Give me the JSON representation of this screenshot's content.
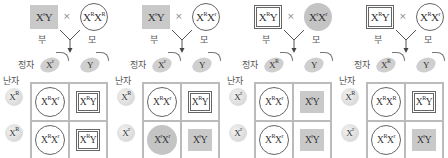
{
  "labels": {
    "father": "부",
    "mother": "모",
    "sperm": "정자",
    "egg": "난자",
    "cross": "×"
  },
  "colors": {
    "affected_fill": "#c4c4c4",
    "outline": "#666666",
    "grid_line": "#bbbbbb"
  },
  "legend_hint": "□ 정상 남자, ■ 적록 색맹 남자, ○ 정상 여자, ● 적록 색맹 여자",
  "panels": [
    {
      "father": {
        "geno": "XʳY",
        "style": "filled-square"
      },
      "mother": {
        "geno": "XᴿXᴿ",
        "style": "outline-circle"
      },
      "sperm": [
        "Xʳ",
        "Y"
      ],
      "eggs": [
        "Xᴿ",
        "Xᴿ"
      ],
      "offspring": [
        [
          {
            "geno": "XᴿXʳ",
            "style": "outline-circle"
          },
          {
            "geno": "XᴿY",
            "style": "outline-square"
          }
        ],
        [
          {
            "geno": "XᴿXʳ",
            "style": "outline-circle"
          },
          {
            "geno": "XᴿY",
            "style": "outline-square"
          }
        ]
      ]
    },
    {
      "father": {
        "geno": "XʳY",
        "style": "filled-square"
      },
      "mother": {
        "geno": "XᴿXʳ",
        "style": "outline-circle"
      },
      "sperm": [
        "Xʳ",
        "Y"
      ],
      "eggs": [
        "Xᴿ",
        "Xʳ"
      ],
      "offspring": [
        [
          {
            "geno": "XᴿXʳ",
            "style": "outline-circle"
          },
          {
            "geno": "XᴿY",
            "style": "outline-square"
          }
        ],
        [
          {
            "geno": "XʳXʳ",
            "style": "filled-circle"
          },
          {
            "geno": "XʳY",
            "style": "filled-square"
          }
        ]
      ]
    },
    {
      "father": {
        "geno": "XᴿY",
        "style": "outline-square"
      },
      "mother": {
        "geno": "XʳXʳ",
        "style": "filled-circle"
      },
      "sperm": [
        "Xᴿ",
        "Y"
      ],
      "eggs": [
        "Xʳ",
        "Xʳ"
      ],
      "offspring": [
        [
          {
            "geno": "XᴿXʳ",
            "style": "outline-circle"
          },
          {
            "geno": "XʳY",
            "style": "filled-square"
          }
        ],
        [
          {
            "geno": "XᴿXʳ",
            "style": "outline-circle"
          },
          {
            "geno": "XʳY",
            "style": "filled-square"
          }
        ]
      ]
    },
    {
      "father": {
        "geno": "XᴿY",
        "style": "outline-square"
      },
      "mother": {
        "geno": "XᴿXʳ",
        "style": "outline-circle"
      },
      "sperm": [
        "Xᴿ",
        "Y"
      ],
      "eggs": [
        "Xᴿ",
        "Xʳ"
      ],
      "offspring": [
        [
          {
            "geno": "XᴿXᴿ",
            "style": "outline-circle"
          },
          {
            "geno": "XᴿY",
            "style": "outline-square"
          }
        ],
        [
          {
            "geno": "XᴿXʳ",
            "style": "outline-circle"
          },
          {
            "geno": "XʳY",
            "style": "filled-square"
          }
        ]
      ]
    }
  ]
}
